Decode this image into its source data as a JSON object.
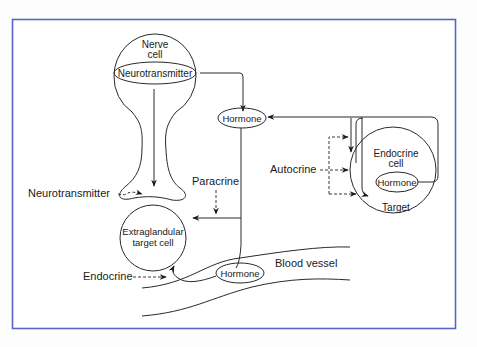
{
  "diagram": {
    "frame_color": "#5a63c9",
    "line_color": "#2a2a2a",
    "nodes": {
      "nerve_cell": {
        "title_line1": "Nerve",
        "title_line2": "cell",
        "inner": "Neurotransmitter"
      },
      "hormone_top": {
        "label": "Hormone"
      },
      "endocrine_cell": {
        "title_line1": "Endocrine",
        "title_line2": "cell",
        "inner": "Hormone",
        "target": "Target"
      },
      "target_cell": {
        "line1": "Extraglandular",
        "line2": "target cell"
      },
      "hormone_vessel": {
        "label": "Hormone"
      },
      "blood_vessel": {
        "label": "Blood vessel"
      }
    },
    "signals": {
      "neurotransmitter": "Neurotransmitter",
      "paracrine": "Paracrine",
      "autocrine": "Autocrine",
      "endocrine": "Endocrine"
    }
  }
}
